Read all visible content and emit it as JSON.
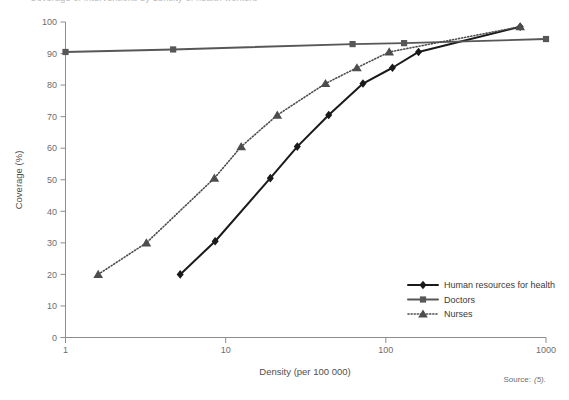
{
  "figure": {
    "clipped_header": "Coverage of interventions by density of health workers",
    "source_prefix": "Source:",
    "source_ref": "(5)."
  },
  "chart_data": {
    "type": "line",
    "title": "",
    "xlabel": "Density (per 100 000)",
    "ylabel": "Coverage (%)",
    "xscale": "log",
    "xlim": [
      1,
      1000
    ],
    "ylim": [
      0,
      100
    ],
    "xticks": [
      1,
      10,
      100,
      1000
    ],
    "xticklabels": [
      "1",
      "10",
      "100",
      "1000"
    ],
    "yticks": [
      0,
      10,
      20,
      30,
      40,
      50,
      60,
      70,
      80,
      90,
      100
    ],
    "yticklabels": [
      "0",
      "10",
      "20",
      "30",
      "40",
      "50",
      "60",
      "70",
      "80",
      "90",
      "100"
    ],
    "grid": false,
    "legend_position": "lower right",
    "series": [
      {
        "name": "Human resources for health",
        "marker": "diamond",
        "linestyle": "solid",
        "color": "#1a1a1a",
        "points": [
          {
            "x": 5.2,
            "y": 20
          },
          {
            "x": 8.6,
            "y": 30.5
          },
          {
            "x": 19,
            "y": 50.5
          },
          {
            "x": 28,
            "y": 60.5
          },
          {
            "x": 44,
            "y": 70.5
          },
          {
            "x": 72,
            "y": 80.5
          },
          {
            "x": 110,
            "y": 85.5
          },
          {
            "x": 160,
            "y": 90.5
          },
          {
            "x": 690,
            "y": 98.5
          }
        ]
      },
      {
        "name": "Doctors",
        "marker": "square",
        "linestyle": "solid",
        "color": "#575757",
        "points": [
          {
            "x": 1,
            "y": 90.5
          },
          {
            "x": 4.7,
            "y": 91.3
          },
          {
            "x": 62,
            "y": 93
          },
          {
            "x": 130,
            "y": 93.3
          },
          {
            "x": 1000,
            "y": 94.6
          }
        ]
      },
      {
        "name": "Nurses",
        "marker": "triangle",
        "linestyle": "dotted",
        "color": "#4d4d4d",
        "points": [
          {
            "x": 1.6,
            "y": 20
          },
          {
            "x": 3.2,
            "y": 30
          },
          {
            "x": 8.5,
            "y": 50.5
          },
          {
            "x": 12.5,
            "y": 60.5
          },
          {
            "x": 21,
            "y": 70.5
          },
          {
            "x": 42,
            "y": 80.5
          },
          {
            "x": 66,
            "y": 85.5
          },
          {
            "x": 105,
            "y": 90.5
          },
          {
            "x": 690,
            "y": 98.5
          }
        ]
      }
    ]
  },
  "legend": {
    "items": [
      {
        "label": "Human resources for health",
        "marker": "diamond",
        "linestyle": "solid",
        "color": "#1a1a1a"
      },
      {
        "label": "Doctors",
        "marker": "square",
        "linestyle": "solid",
        "color": "#575757"
      },
      {
        "label": "Nurses",
        "marker": "triangle",
        "linestyle": "dotted",
        "color": "#4d4d4d"
      }
    ]
  }
}
